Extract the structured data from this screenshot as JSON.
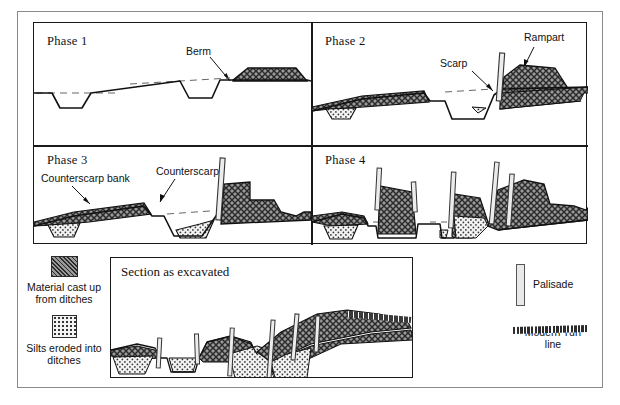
{
  "figure": {
    "type": "archaeological-section-diagram",
    "panels": [
      {
        "id": "phase1",
        "label": "Phase 1",
        "annotations": [
          {
            "name": "berm",
            "text": "Berm"
          }
        ]
      },
      {
        "id": "phase2",
        "label": "Phase 2",
        "annotations": [
          {
            "name": "scarp",
            "text": "Scarp"
          },
          {
            "name": "rampart",
            "text": "Rampart"
          }
        ]
      },
      {
        "id": "phase3",
        "label": "Phase 3",
        "annotations": [
          {
            "name": "counterscarp-bank",
            "text": "Counterscarp bank"
          },
          {
            "name": "counterscarp",
            "text": "Counterscarp"
          }
        ]
      },
      {
        "id": "phase4",
        "label": "Phase 4",
        "annotations": []
      }
    ],
    "section": {
      "title": "Section as excavated"
    },
    "legend_left": [
      {
        "swatch": "cross-hatch-dark",
        "label_line1": "Material cast up",
        "label_line2": "from ditches"
      },
      {
        "swatch": "stipple-dotted-light",
        "label_line1": "Silts eroded into",
        "label_line2": "ditches"
      }
    ],
    "legend_right": [
      {
        "swatch": "palisade-post",
        "label": "Palisade"
      },
      {
        "swatch": "turf-line",
        "label_line1": "Modern Turf",
        "label_line2": "line"
      }
    ],
    "colors": {
      "ink": "#111111",
      "frame": "#8a8a8a",
      "cast_fill": "#6e6e6e",
      "silt_fill": "#d8d8d8",
      "turf_fill": "#2b2b2b"
    }
  }
}
